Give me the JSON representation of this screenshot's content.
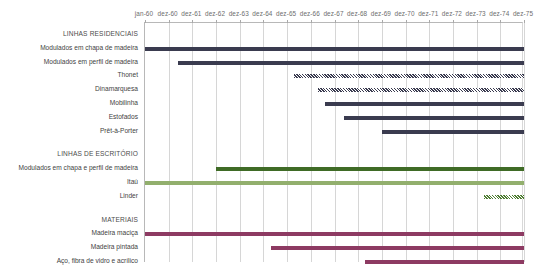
{
  "chart_data": {
    "type": "bar",
    "orientation": "horizontal",
    "subtype": "gantt",
    "title": "",
    "xlabel": "",
    "ylabel": "",
    "grid": true,
    "legend": false,
    "axis_ticks": [
      "jan-60",
      "dez-60",
      "dez-61",
      "dez-62",
      "dez-63",
      "dez-64",
      "dez-65",
      "dez-66",
      "dez-67",
      "dez-68",
      "dez-69",
      "dez-70",
      "dez-71",
      "dez-72",
      "dez-73",
      "dez-74",
      "dez-75"
    ],
    "x_start": "jan-60",
    "x_end": "dez-75",
    "xlim": [
      1960.0,
      1976.0
    ],
    "colors": {
      "residencial": "#3a3b4f",
      "escritorio_dark": "#3f6b26",
      "escritorio_light": "#92af6d",
      "materiais": "#8d3a62",
      "gridline": "#d6d6d6",
      "axis": "#b8b8b8",
      "text": "#3f3f3f"
    },
    "sections": [
      {
        "name": "LINHAS RESIDENCIAIS",
        "color": "#3a3b4f",
        "rows": [
          {
            "label": "Modulados em chapa de madeira",
            "start": 1960.0,
            "end": 1976.0,
            "style": "solid",
            "color": "#3a3b4f"
          },
          {
            "label": "Modulados em perfil de madeira",
            "start": 1961.4,
            "end": 1976.0,
            "style": "solid",
            "color": "#3a3b4f"
          },
          {
            "label": "Thonet",
            "start": 1966.3,
            "end": 1976.0,
            "style": "hatched",
            "color": "#3a3b4f"
          },
          {
            "label": "Dinamarquesa",
            "start": 1967.3,
            "end": 1976.0,
            "style": "hatched",
            "color": "#3a3b4f"
          },
          {
            "label": "Mobilinha",
            "start": 1967.6,
            "end": 1976.0,
            "style": "solid",
            "color": "#3a3b4f"
          },
          {
            "label": "Estofados",
            "start": 1968.4,
            "end": 1976.0,
            "style": "solid",
            "color": "#3a3b4f"
          },
          {
            "label": "Prêt-à-Porter",
            "start": 1970.0,
            "end": 1976.0,
            "style": "solid",
            "color": "#3a3b4f"
          }
        ]
      },
      {
        "name": "LINHAS DE ESCRITÓRIO",
        "color": "#3f6b26",
        "rows": [
          {
            "label": "Modulados em chapa e perfil de madeira",
            "start": 1963.0,
            "end": 1976.0,
            "style": "solid",
            "color": "#3f6b26"
          },
          {
            "label": "Itaú",
            "start": 1960.0,
            "end": 1976.0,
            "style": "solid",
            "color": "#92af6d"
          },
          {
            "label": "Linder",
            "start": 1974.3,
            "end": 1976.0,
            "style": "hatched",
            "color": "#4f7d33"
          }
        ]
      },
      {
        "name": "MATERIAIS",
        "color": "#8d3a62",
        "rows": [
          {
            "label": "Madeira maciça",
            "start": 1960.0,
            "end": 1976.0,
            "style": "solid",
            "color": "#8d3a62"
          },
          {
            "label": "Madeira pintada",
            "start": 1965.3,
            "end": 1976.0,
            "style": "solid",
            "color": "#8d3a62"
          },
          {
            "label": "Aço, fibra de vidro e acrílico",
            "start": 1969.3,
            "end": 1976.0,
            "style": "solid",
            "color": "#8d3a62"
          }
        ]
      }
    ]
  }
}
